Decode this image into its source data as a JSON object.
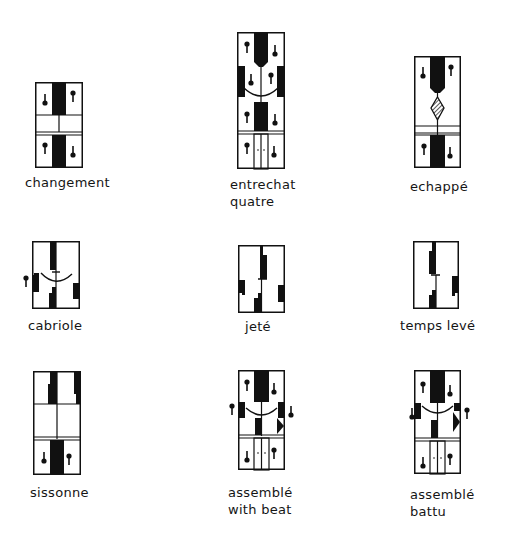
{
  "figures": [
    {
      "id": "changement",
      "label_lines": [
        "changement"
      ]
    },
    {
      "id": "entrechat-quatre",
      "label_lines": [
        "entrechat",
        "quatre"
      ]
    },
    {
      "id": "echappe",
      "label_lines": [
        "echappé"
      ]
    },
    {
      "id": "cabriole",
      "label_lines": [
        "cabriole"
      ]
    },
    {
      "id": "jete",
      "label_lines": [
        "jeté"
      ]
    },
    {
      "id": "temps-leve",
      "label_lines": [
        "temps levé"
      ]
    },
    {
      "id": "sissonne",
      "label_lines": [
        "sissonne"
      ]
    },
    {
      "id": "assemble-with-beat",
      "label_lines": [
        "assemblé",
        "with beat"
      ]
    },
    {
      "id": "assemble-battu",
      "label_lines": [
        "assemblé",
        "battu"
      ]
    }
  ],
  "colors": {
    "ink": "#111111",
    "paper": "#ffffff"
  }
}
